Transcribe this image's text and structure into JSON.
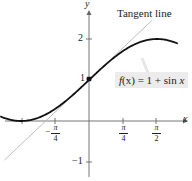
{
  "chart_data": {
    "type": "line",
    "title": "",
    "xlabel": "x",
    "ylabel": "y",
    "xlim": [
      -1.05,
      2.05
    ],
    "ylim": [
      -1.35,
      2.7
    ],
    "grid": false,
    "x_ticks": [
      {
        "value": -0.785,
        "num": "π",
        "den": "4",
        "sign": "−"
      },
      {
        "value": 0.785,
        "num": "π",
        "den": "4",
        "sign": ""
      },
      {
        "value": 1.571,
        "num": "π",
        "den": "2",
        "sign": ""
      }
    ],
    "y_ticks": [
      {
        "value": -1,
        "label": "−1"
      },
      {
        "value": 1,
        "label": "1"
      },
      {
        "value": 2,
        "label": "2"
      }
    ],
    "series": [
      {
        "name": "f(x) = 1 + sin x",
        "type": "curve",
        "color": "#111111",
        "expression": "1 + sin(x)",
        "x_range": [
          -2.05,
          2.05
        ]
      },
      {
        "name": "Tangent line",
        "type": "line",
        "color": "#b5b5b5",
        "expression": "1 + x",
        "x_range": [
          -1.95,
          1.45
        ]
      }
    ],
    "points": [
      {
        "x": 0,
        "y": 1,
        "marker": "square"
      }
    ],
    "annotations": [
      {
        "text": "Tangent line",
        "position": "top-right"
      },
      {
        "text": "f(x) = 1 + sin x",
        "position": "right",
        "boxed": true
      }
    ]
  },
  "labels": {
    "x_axis": "x",
    "y_axis": "y",
    "tangent": "Tangent line",
    "func_f": "f",
    "func_rest": "(x) = 1 + sin ",
    "func_x": "x",
    "y1": "1",
    "y2": "2",
    "ym1": "−1",
    "pi": "π",
    "four": "4",
    "two": "2",
    "minus": "−"
  }
}
